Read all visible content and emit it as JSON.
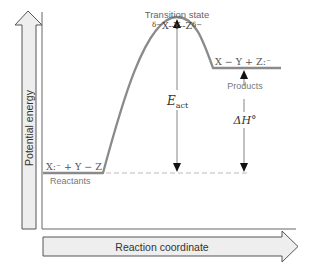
{
  "diagram": {
    "type": "reaction-energy-profile",
    "y_axis": {
      "label": "Potential energy"
    },
    "x_axis": {
      "label": "Reaction coordinate"
    },
    "transition_state": {
      "title": "Transition state",
      "species_prefix": "δ−",
      "species_body": "X--Y--Z",
      "species_suffix": "δ−"
    },
    "reactants": {
      "species": "X:⁻ + Y − Z",
      "label": "Reactants"
    },
    "products": {
      "species": "X − Y + Z:⁻",
      "label": "Products"
    },
    "activation_energy": {
      "symbol": "E",
      "subscript": "act"
    },
    "enthalpy_change": {
      "symbol": "ΔH°"
    },
    "colors": {
      "curve": "#8a8a8a",
      "arrow_fill": "#eeeeee",
      "arrow_stroke": "#555555",
      "text": "#444444",
      "label_gray": "#777777",
      "dashed": "#bbbbbb"
    }
  }
}
